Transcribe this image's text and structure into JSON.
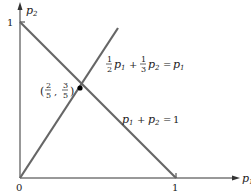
{
  "diagram": {
    "axes": {
      "x_label": "p",
      "x_sub": "1",
      "y_label": "p",
      "y_sub": "2",
      "origin_label": "0",
      "x_tick_label": "1",
      "y_tick_label": "1"
    },
    "lines": [
      {
        "name": "budget-line",
        "equation": "p1 + p2 = 1",
        "label_parts": {
          "a": "p",
          "a_sub": "1",
          "plus": "+",
          "b": "p",
          "b_sub": "2",
          "eq": "=",
          "rhs": "1"
        }
      },
      {
        "name": "equilibrium-line",
        "equation": "1/2 p1 + 1/3 p2 = p1",
        "label_parts": {
          "f1n": "1",
          "f1d": "2",
          "a": "p",
          "a_sub": "1",
          "plus": "+",
          "f2n": "1",
          "f2d": "3",
          "b": "p",
          "b_sub": "2",
          "eq": "=",
          "rhs": "p",
          "rhs_sub": "1"
        }
      }
    ],
    "intersection": {
      "label_open": "(",
      "xn": "2",
      "xd": "5",
      "comma": ",",
      "yn": "3",
      "yd": "5",
      "label_close": ")",
      "point": [
        0.4,
        0.6
      ]
    },
    "colors": {
      "axis": "#333333",
      "line": "#666666",
      "point": "#000000"
    }
  }
}
